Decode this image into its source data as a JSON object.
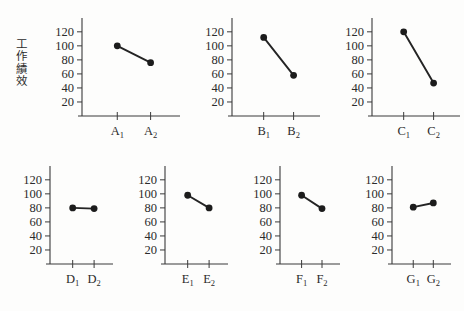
{
  "figure": {
    "y_axis_label": "工作績效",
    "y_axis_label_chars": [
      "工",
      "作",
      "績",
      "效"
    ],
    "background_color": "#fdfdfc",
    "ink_color": "#2b2b2b",
    "marker_color": "#1c1c1c"
  },
  "chart_data": [
    {
      "type": "line",
      "id": "panel-a",
      "title": "",
      "xlabel": "",
      "ylabel": "工作績效",
      "categories": [
        "A₁",
        "A₂"
      ],
      "category_base": "A",
      "values": [
        100,
        76
      ],
      "ylim": [
        0,
        134
      ],
      "yticks": [
        20,
        40,
        60,
        80,
        100,
        120
      ],
      "ytick_labels": [
        "20",
        "40",
        "60",
        "80",
        "100",
        "120"
      ],
      "grid": false,
      "legend": "none"
    },
    {
      "type": "line",
      "id": "panel-b",
      "title": "",
      "xlabel": "",
      "ylabel": "",
      "categories": [
        "B₁",
        "B₂"
      ],
      "category_base": "B",
      "values": [
        112,
        58
      ],
      "ylim": [
        0,
        134
      ],
      "yticks": [
        20,
        40,
        60,
        80,
        100,
        120
      ],
      "ytick_labels": [
        "20",
        "40",
        "60",
        "80",
        "100",
        "120"
      ],
      "grid": false,
      "legend": "none"
    },
    {
      "type": "line",
      "id": "panel-c",
      "title": "",
      "xlabel": "",
      "ylabel": "",
      "categories": [
        "C₁",
        "C₂"
      ],
      "category_base": "C",
      "values": [
        120,
        47
      ],
      "ylim": [
        0,
        134
      ],
      "yticks": [
        20,
        40,
        60,
        80,
        100,
        120
      ],
      "ytick_labels": [
        "20",
        "40",
        "60",
        "80",
        "100",
        "120"
      ],
      "grid": false,
      "legend": "none"
    },
    {
      "type": "line",
      "id": "panel-d",
      "title": "",
      "xlabel": "",
      "ylabel": "",
      "categories": [
        "D₁",
        "D₂"
      ],
      "category_base": "D",
      "values": [
        80,
        79
      ],
      "ylim": [
        0,
        134
      ],
      "yticks": [
        20,
        40,
        60,
        80,
        100,
        120
      ],
      "ytick_labels": [
        "20",
        "40",
        "60",
        "80",
        "100",
        "120"
      ],
      "grid": false,
      "legend": "none"
    },
    {
      "type": "line",
      "id": "panel-e",
      "title": "",
      "xlabel": "",
      "ylabel": "",
      "categories": [
        "E₁",
        "E₂"
      ],
      "category_base": "E",
      "values": [
        98,
        80
      ],
      "ylim": [
        0,
        134
      ],
      "yticks": [
        20,
        40,
        60,
        80,
        100,
        120
      ],
      "ytick_labels": [
        "20",
        "40",
        "60",
        "80",
        "100",
        "120"
      ],
      "grid": false,
      "legend": "none"
    },
    {
      "type": "line",
      "id": "panel-f",
      "title": "",
      "xlabel": "",
      "ylabel": "",
      "categories": [
        "F₁",
        "F₂"
      ],
      "category_base": "F",
      "values": [
        98,
        79
      ],
      "ylim": [
        0,
        134
      ],
      "yticks": [
        20,
        40,
        60,
        80,
        100,
        120
      ],
      "ytick_labels": [
        "20",
        "40",
        "60",
        "80",
        "100",
        "120"
      ],
      "grid": false,
      "legend": "none"
    },
    {
      "type": "line",
      "id": "panel-g",
      "title": "",
      "xlabel": "",
      "ylabel": "",
      "categories": [
        "G₁",
        "G₂"
      ],
      "category_base": "G",
      "values": [
        81,
        87
      ],
      "ylim": [
        0,
        134
      ],
      "yticks": [
        20,
        40,
        60,
        80,
        100,
        120
      ],
      "ytick_labels": [
        "20",
        "40",
        "60",
        "80",
        "100",
        "120"
      ],
      "grid": false,
      "legend": "none"
    }
  ],
  "layout": {
    "rows": [
      {
        "panel_ids": [
          "panel-a",
          "panel-b",
          "panel-c"
        ]
      },
      {
        "panel_ids": [
          "panel-d",
          "panel-e",
          "panel-f",
          "panel-g"
        ]
      }
    ]
  }
}
